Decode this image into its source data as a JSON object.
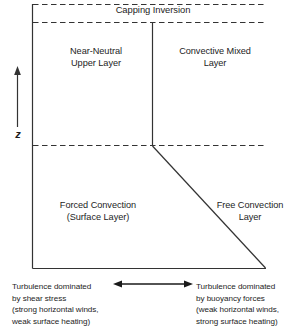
{
  "diagram": {
    "axis": {
      "vertical_label": "z",
      "vertical_arrow": "upward-arrow"
    },
    "boundaries": {
      "capping_inversion_label": "Capping Inversion"
    },
    "regions": [
      {
        "id": "near-neutral-upper-layer",
        "label": "Near-Neutral\nUpper Layer"
      },
      {
        "id": "convective-mixed-layer",
        "label": "Convective Mixed\nLayer"
      },
      {
        "id": "forced-convection-surface-layer",
        "label": "Forced Convection\n(Surface Layer)"
      },
      {
        "id": "free-convection-layer",
        "label": "Free Convection\nLayer"
      }
    ],
    "captions": {
      "left": "Turbulence dominated\nby shear stress\n(strong horizontal winds,\nweak surface heating)",
      "right": "Turbulence dominated\nby buoyancy forces\n(weak horizontal winds,\nstrong surface heating)"
    },
    "colors": {
      "line": "#333333",
      "text": "#1d1d1d",
      "background": "#ffffff"
    }
  }
}
